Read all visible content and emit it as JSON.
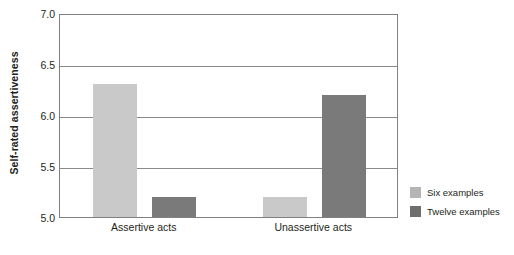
{
  "chart_data": {
    "type": "bar",
    "title": "",
    "xlabel": "",
    "ylabel": "Self-rated assertiveness",
    "categories": [
      "Assertive acts",
      "Unassertive acts"
    ],
    "series": [
      {
        "name": "Six examples",
        "values": [
          6.3,
          5.2
        ],
        "color": "#c9c9c9"
      },
      {
        "name": "Twelve examples",
        "values": [
          5.2,
          6.2
        ],
        "color": "#7a7a7a"
      }
    ],
    "ylim": [
      5.0,
      7.0
    ],
    "yticks": [
      "5.0",
      "5.5",
      "6.0",
      "6.5",
      "7.0"
    ],
    "ytick_values": [
      5.0,
      5.5,
      6.0,
      6.5,
      7.0
    ],
    "grid": true,
    "legend_position": "right"
  },
  "legend": {
    "items": [
      {
        "label": "Six examples",
        "swatch": "#b5b5b5"
      },
      {
        "label": "Twelve examples",
        "swatch": "#6e6e6e"
      }
    ]
  }
}
